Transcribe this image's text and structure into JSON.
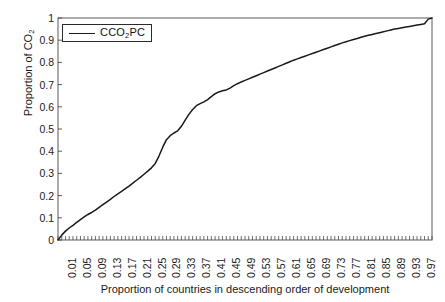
{
  "chart_data": {
    "type": "line",
    "title": "",
    "xlabel": "Proportion of countries in descending order of development",
    "ylabel": "Proportion of CO2",
    "ylabel_parts": {
      "pre": "Proportion of CO",
      "sub": "2"
    },
    "legend": [
      {
        "name": "CCO2PC",
        "name_parts": {
          "pre": "CCO",
          "sub": "2",
          "post": "PC"
        },
        "color": "#1a1a1a"
      }
    ],
    "legend_position": "top-left-inside",
    "grid": false,
    "xlim": [
      0,
      1
    ],
    "ylim": [
      0,
      1
    ],
    "ytick_labels": [
      "0",
      "0.1",
      "0.2",
      "0.3",
      "0.4",
      "0.5",
      "0.6",
      "0.7",
      "0.8",
      "0.9",
      "1"
    ],
    "ytick_values": [
      0,
      0.1,
      0.2,
      0.3,
      0.4,
      0.5,
      0.6,
      0.7,
      0.8,
      0.9,
      1
    ],
    "xtick_labels": [
      "0.01",
      "0.05",
      "0.09",
      "0.13",
      "0.17",
      "0.21",
      "0.25",
      "0.29",
      "0.33",
      "0.37",
      "0.41",
      "0.45",
      "0.49",
      "0.53",
      "0.57",
      "0.61",
      "0.65",
      "0.69",
      "0.73",
      "0.77",
      "0.81",
      "0.85",
      "0.89",
      "0.93",
      "0.97"
    ],
    "xtick_values": [
      0.01,
      0.05,
      0.09,
      0.13,
      0.17,
      0.21,
      0.25,
      0.29,
      0.33,
      0.37,
      0.41,
      0.45,
      0.49,
      0.53,
      0.57,
      0.61,
      0.65,
      0.69,
      0.73,
      0.77,
      0.81,
      0.85,
      0.89,
      0.93,
      0.97
    ],
    "xtick_minor_step": 0.01,
    "series": [
      {
        "name": "CCO2PC",
        "x": [
          0.0,
          0.01,
          0.02,
          0.03,
          0.04,
          0.05,
          0.06,
          0.07,
          0.08,
          0.09,
          0.1,
          0.11,
          0.12,
          0.13,
          0.14,
          0.15,
          0.16,
          0.17,
          0.18,
          0.19,
          0.2,
          0.21,
          0.22,
          0.23,
          0.24,
          0.25,
          0.26,
          0.27,
          0.28,
          0.29,
          0.3,
          0.31,
          0.32,
          0.33,
          0.34,
          0.35,
          0.36,
          0.37,
          0.38,
          0.39,
          0.4,
          0.41,
          0.42,
          0.43,
          0.44,
          0.45,
          0.46,
          0.47,
          0.48,
          0.49,
          0.5,
          0.51,
          0.52,
          0.53,
          0.54,
          0.55,
          0.56,
          0.57,
          0.58,
          0.59,
          0.6,
          0.61,
          0.62,
          0.63,
          0.64,
          0.65,
          0.66,
          0.67,
          0.68,
          0.69,
          0.7,
          0.71,
          0.72,
          0.73,
          0.74,
          0.75,
          0.76,
          0.77,
          0.78,
          0.79,
          0.8,
          0.81,
          0.82,
          0.83,
          0.84,
          0.85,
          0.86,
          0.87,
          0.88,
          0.89,
          0.9,
          0.91,
          0.92,
          0.93,
          0.94,
          0.95,
          0.96,
          0.97,
          0.98,
          0.99,
          1.0
        ],
        "y": [
          0.0,
          0.022,
          0.04,
          0.054,
          0.066,
          0.079,
          0.092,
          0.104,
          0.115,
          0.124,
          0.135,
          0.147,
          0.159,
          0.171,
          0.183,
          0.196,
          0.208,
          0.219,
          0.231,
          0.243,
          0.256,
          0.269,
          0.282,
          0.296,
          0.31,
          0.325,
          0.345,
          0.378,
          0.418,
          0.452,
          0.47,
          0.482,
          0.492,
          0.512,
          0.54,
          0.566,
          0.588,
          0.605,
          0.614,
          0.622,
          0.632,
          0.646,
          0.659,
          0.667,
          0.672,
          0.676,
          0.684,
          0.695,
          0.704,
          0.712,
          0.719,
          0.726,
          0.733,
          0.74,
          0.747,
          0.754,
          0.761,
          0.768,
          0.775,
          0.782,
          0.789,
          0.796,
          0.803,
          0.81,
          0.816,
          0.822,
          0.828,
          0.834,
          0.84,
          0.846,
          0.852,
          0.858,
          0.864,
          0.87,
          0.876,
          0.882,
          0.888,
          0.893,
          0.898,
          0.903,
          0.908,
          0.913,
          0.918,
          0.922,
          0.926,
          0.93,
          0.934,
          0.938,
          0.942,
          0.946,
          0.95,
          0.953,
          0.956,
          0.959,
          0.962,
          0.965,
          0.968,
          0.971,
          0.974,
          0.995,
          1.0
        ]
      }
    ]
  },
  "axes": {
    "plot_left_px": 58,
    "plot_top_px": 18,
    "plot_right_px": 432,
    "plot_bottom_px": 240
  }
}
